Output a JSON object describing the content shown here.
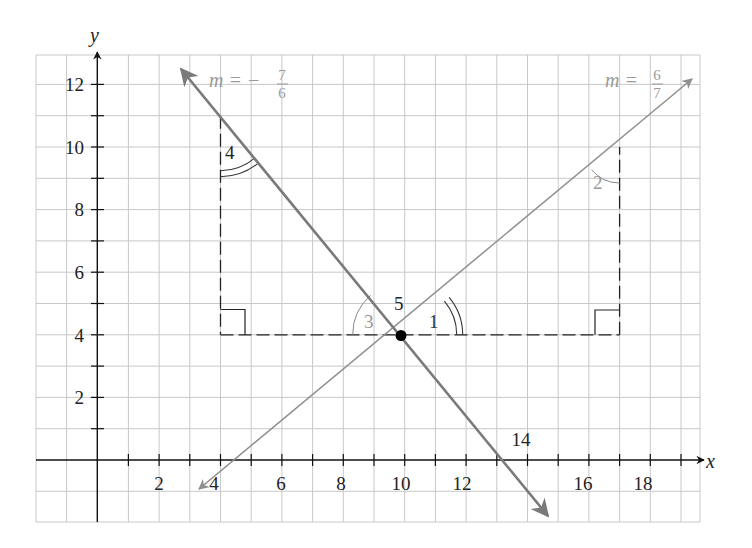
{
  "diagram": {
    "type": "coordinate-plane",
    "axes": {
      "x_label": "x",
      "y_label": "y",
      "x_ticks": [
        {
          "value": 2,
          "label": "2"
        },
        {
          "value": 4,
          "label": "4"
        },
        {
          "value": 6,
          "label": "6"
        },
        {
          "value": 8,
          "label": "8"
        },
        {
          "value": 10,
          "label": "10"
        },
        {
          "value": 12,
          "label": "12"
        },
        {
          "value": 14,
          "label": "14"
        },
        {
          "value": 16,
          "label": "16"
        },
        {
          "value": 18,
          "label": "18"
        }
      ],
      "y_ticks": [
        {
          "value": 2,
          "label": "2"
        },
        {
          "value": 4,
          "label": "4"
        },
        {
          "value": 6,
          "label": "6"
        },
        {
          "value": 8,
          "label": "8"
        },
        {
          "value": 10,
          "label": "10"
        },
        {
          "value": 12,
          "label": "12"
        }
      ]
    },
    "lines": [
      {
        "name": "line-positive-slope",
        "slope_label_m": "m =",
        "slope_num": "6",
        "slope_den": "7",
        "color": "#8f8f8f"
      },
      {
        "name": "line-negative-slope",
        "slope_label_m": "m = −",
        "slope_num": "7",
        "slope_den": "6",
        "color": "#7a7a7a"
      }
    ],
    "intersection_point": {
      "x": 10,
      "y": 4,
      "label": "5"
    },
    "angle_labels": {
      "a1": "1",
      "a2": "2",
      "a3": "3",
      "a4": "4"
    },
    "triangles": [
      {
        "vertices": [
          [
            4,
            11
          ],
          [
            4,
            4
          ],
          [
            10,
            4
          ]
        ],
        "right_angle_at": [
          4,
          4
        ]
      },
      {
        "vertices": [
          [
            10,
            4
          ],
          [
            17,
            4
          ],
          [
            17,
            10
          ]
        ],
        "right_angle_at": [
          17,
          4
        ]
      }
    ]
  }
}
